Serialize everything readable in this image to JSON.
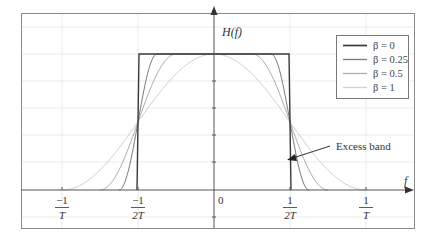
{
  "chart_data": {
    "type": "line",
    "title": "",
    "xlabel": "f",
    "ylabel": "H(f)",
    "x_ticks": [
      {
        "num": "−1",
        "den": "T",
        "value_T": -1.0
      },
      {
        "num": "−1",
        "den": "2T",
        "value_T": -0.5
      },
      {
        "num": "0",
        "den": "",
        "value_T": 0.0
      },
      {
        "num": "1",
        "den": "2T",
        "value_T": 0.5
      },
      {
        "num": "1",
        "den": "T",
        "value_T": 1.0
      }
    ],
    "xlim_T": [
      -1.27,
      1.32
    ],
    "ylim": [
      -0.28,
      1.3
    ],
    "grid": true,
    "legend_position": "upper right",
    "series": [
      {
        "name": "β = 0",
        "beta": 0,
        "color": "#3a3a3a",
        "width": 1.4
      },
      {
        "name": "β = 0.25",
        "beta": 0.25,
        "color": "#7a7a7a",
        "width": 1.0
      },
      {
        "name": "β = 0.5",
        "beta": 0.5,
        "color": "#acacac",
        "width": 1.0
      },
      {
        "name": "β = 1",
        "beta": 1,
        "color": "#cfcfcf",
        "width": 1.0
      }
    ],
    "formula": "raised cosine: H(f)=1 for |f|<=(1-β)/2T; 0.5[1+cos(πT/β(|f|-(1-β)/2T))] for (1-β)/2T<|f|<=(1+β)/2T; 0 otherwise",
    "sample_values": {
      "f_T": [
        0,
        0.25,
        0.375,
        0.5,
        0.625,
        0.75,
        1.0
      ],
      "beta_0": [
        1,
        1,
        1,
        0.5,
        0,
        0,
        0
      ],
      "beta_0.25": [
        1,
        1,
        1,
        0.5,
        0,
        0,
        0
      ],
      "beta_0.5": [
        1,
        1,
        0.854,
        0.5,
        0.146,
        0,
        0
      ],
      "beta_1": [
        1,
        0.854,
        0.691,
        0.5,
        0.309,
        0.146,
        0
      ]
    },
    "annotations": [
      {
        "text": "Excess band",
        "arrow_to_f_T": 0.48,
        "arrow_to_H": 0.22
      }
    ]
  },
  "labels": {
    "y_axis": "H(f)",
    "x_axis": "f",
    "annotation": "Excess band",
    "zero": "0"
  }
}
